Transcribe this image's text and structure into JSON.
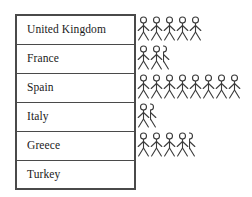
{
  "chart_data": {
    "type": "pictogram",
    "title": "",
    "xlabel": "",
    "ylabel": "",
    "symbol": "person-figure",
    "symbol_value": 1,
    "half_symbol_allowed": true,
    "categories": [
      "United Kingdom",
      "France",
      "Spain",
      "Italy",
      "Greece",
      "Turkey"
    ],
    "values": [
      5,
      2.5,
      8,
      1.5,
      4.5,
      0
    ],
    "rows": [
      {
        "label": "United Kingdom",
        "value": 5,
        "full_figures": 5,
        "half_figures": 0
      },
      {
        "label": "France",
        "value": 2.5,
        "full_figures": 2,
        "half_figures": 1
      },
      {
        "label": "Spain",
        "value": 8,
        "full_figures": 8,
        "half_figures": 0
      },
      {
        "label": "Italy",
        "value": 1.5,
        "full_figures": 1,
        "half_figures": 1
      },
      {
        "label": "Greece",
        "value": 4.5,
        "full_figures": 4,
        "half_figures": 1
      },
      {
        "label": "Turkey",
        "value": 0,
        "full_figures": 0,
        "half_figures": 0
      }
    ],
    "colors": {
      "figure_stroke": "#3a3a3a",
      "table_border": "#4a4a4a",
      "label_text": "#1a1a1a",
      "background": "#ffffff"
    }
  }
}
